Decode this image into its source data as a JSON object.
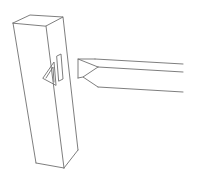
{
  "diagram": {
    "title": "",
    "line_color": "#6f6f6f",
    "background": "#ffffff",
    "parts": [
      {
        "name": "post",
        "description": "vertical rectangular post drawn in perspective"
      },
      {
        "name": "post-mortise",
        "description": "triangular cut-out and slot on the post face"
      },
      {
        "name": "rail",
        "description": "horizontal rail extending to the right"
      },
      {
        "name": "rail-tenon",
        "description": "V-shaped notch at the rail's end facing the post"
      }
    ]
  }
}
